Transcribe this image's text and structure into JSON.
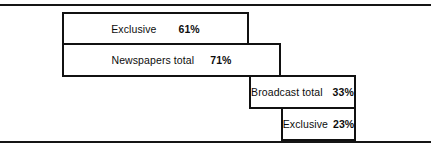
{
  "figure": {
    "background_color": "#ffffff",
    "line_color": "#111111",
    "text_color": "#0d0d0d",
    "rules": {
      "top_label": "top-rule",
      "bottom_label": "bottom-rule"
    }
  },
  "chart_data": {
    "type": "bar",
    "title": "",
    "subtitle": "",
    "xlabel": "",
    "ylabel": "",
    "orientation": "horizontal",
    "grid": false,
    "legend": "none",
    "unit": "%",
    "xlim": [
      0,
      100
    ],
    "categories": [
      "Exclusive",
      "Newspapers total",
      "Broadcast total",
      "Exclusive"
    ],
    "values": [
      61,
      71,
      33,
      23
    ],
    "value_labels": [
      "61%",
      "71%",
      "33%",
      "23%"
    ],
    "bars": [
      {
        "label": "Exclusive",
        "value": 61,
        "value_label": "61%",
        "group": "Newspapers"
      },
      {
        "label": "Newspapers total",
        "value": 71,
        "value_label": "71%",
        "group": "Newspapers"
      },
      {
        "label": "Broadcast total",
        "value": 33,
        "value_label": "33%",
        "group": "Broadcast"
      },
      {
        "label": "Exclusive",
        "value": 23,
        "value_label": "23%",
        "group": "Broadcast"
      }
    ]
  }
}
